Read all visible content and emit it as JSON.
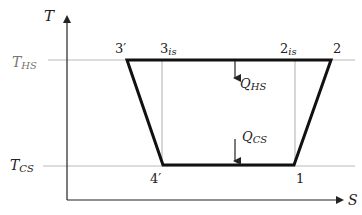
{
  "diagram": {
    "type": "T-S diagram",
    "axes": {
      "y_label": "T",
      "x_label": "S"
    },
    "isotherms": [
      {
        "id": "hot",
        "label_main": "T",
        "label_sub": "HS",
        "y": 60
      },
      {
        "id": "cold",
        "label_main": "T",
        "label_sub": "CS",
        "y": 166
      }
    ],
    "points": [
      {
        "id": "3prime",
        "label": "3′",
        "x": 127,
        "y": 60
      },
      {
        "id": "3is",
        "label_main": "3",
        "label_sub": "is",
        "x": 162,
        "y": 60
      },
      {
        "id": "2is",
        "label_main": "2",
        "label_sub": "is",
        "x": 295,
        "y": 60
      },
      {
        "id": "2",
        "label": "2",
        "x": 331,
        "y": 60
      },
      {
        "id": "4prime",
        "label": "4′",
        "x": 163,
        "y": 165
      },
      {
        "id": "1",
        "label": "1",
        "x": 294,
        "y": 165
      }
    ],
    "heat_flows": [
      {
        "id": "q_hs",
        "label_main": "Q",
        "label_sub": "HS"
      },
      {
        "id": "q_cs",
        "label_main": "Q",
        "label_sub": "CS"
      }
    ],
    "colors": {
      "cycle": "#111111",
      "guide": "#9a9a9a",
      "axis": "#222222"
    }
  }
}
